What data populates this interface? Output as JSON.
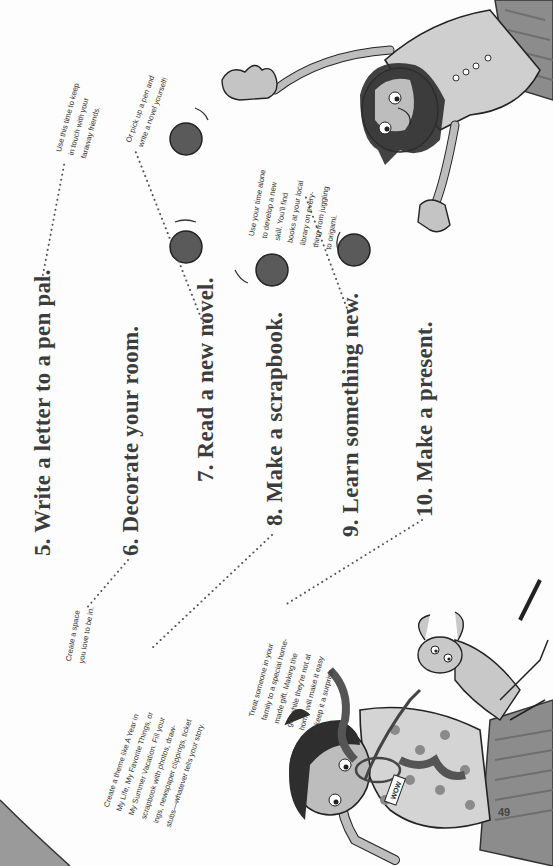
{
  "page": {
    "number": "49",
    "orientation": "rotated-90-ccw"
  },
  "items": [
    {
      "id": 5,
      "headline": "5. Write a letter to a pen pal.",
      "caption": "Use this time to keep\nin touch with your\nfaraway friends."
    },
    {
      "id": 6,
      "headline": "6. Decorate your room.",
      "caption": "Create a space\nyou love to be in."
    },
    {
      "id": 7,
      "headline": "7. Read a new novel.",
      "caption": "Or pick up a pen and\nwrite a novel yourself!"
    },
    {
      "id": 8,
      "headline": "8. Make a scrapbook.",
      "caption": "Create a theme like A Year in\nMy Life, My Favorite Things, or\nMy Summer Vacation. Fill your\nscrapbook with photos, draw-\nings, newspaper clippings, ticket\nstubs—whatever tells your story."
    },
    {
      "id": 9,
      "headline": "9. Learn something new.",
      "caption": "Use your time alone\nto develop a new\nskill. You'll find\nbooks at your local\nlibrary on every-\nthing from juggling\nto origami."
    },
    {
      "id": 10,
      "headline": "10. Make a present.",
      "caption": "Treat someone in your\nfamily to a special home-\nmade gift. Making the\ngift while they're not at\nhome will make it easy\nto keep it a surprise."
    }
  ],
  "illustrations": {
    "top_right": "girl-juggling-balls",
    "bottom": "girl-holding-gift-with-dog",
    "gift_tag": "WOW"
  },
  "colors": {
    "text": "#3c3c3c",
    "ball": "#5a5a5a",
    "skin": "#b9b9b9",
    "hair": "#2e2e2e",
    "shirt": "#cfcfcf",
    "ribbon": "#555555",
    "dots": "#8a8a8a"
  }
}
